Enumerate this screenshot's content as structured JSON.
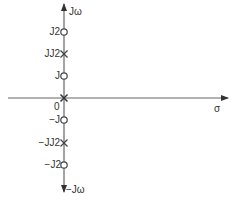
{
  "diagram": {
    "type": "pole-zero plot",
    "axes": {
      "vertical_top_label": "Jω",
      "vertical_bottom_label": "−Jω",
      "horizontal_label": "σ",
      "origin_label": "0"
    },
    "markers": [
      {
        "label": "J2",
        "kind": "zero",
        "symbol": "circle"
      },
      {
        "label": "JJ2",
        "kind": "pole",
        "symbol": "cross"
      },
      {
        "label": "J",
        "kind": "zero",
        "symbol": "circle"
      },
      {
        "label": "0",
        "kind": "pole",
        "symbol": "cross"
      },
      {
        "label": "−J",
        "kind": "zero",
        "symbol": "circle"
      },
      {
        "label": "−JJ2",
        "kind": "pole",
        "symbol": "cross"
      },
      {
        "label": "−J2",
        "kind": "zero",
        "symbol": "circle"
      }
    ],
    "colors": {
      "axis": "#555555",
      "marker": "#444444",
      "text": "#333333"
    }
  }
}
